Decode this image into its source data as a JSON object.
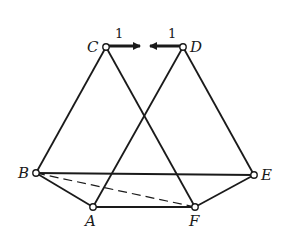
{
  "diagram": {
    "type": "truss-linkage",
    "nodes": [
      {
        "id": "C",
        "label": "C",
        "x": 106,
        "y": 47,
        "lx": 87,
        "ly": 52
      },
      {
        "id": "D",
        "label": "D",
        "x": 183,
        "y": 47,
        "lx": 190,
        "ly": 52
      },
      {
        "id": "B",
        "label": "B",
        "x": 36,
        "y": 173,
        "lx": 18,
        "ly": 178
      },
      {
        "id": "E",
        "label": "E",
        "x": 254,
        "y": 175,
        "lx": 261,
        "ly": 180
      },
      {
        "id": "A",
        "label": "A",
        "x": 93,
        "y": 207,
        "lx": 85,
        "ly": 226
      },
      {
        "id": "F",
        "label": "F",
        "x": 195,
        "y": 207,
        "lx": 189,
        "ly": 226
      }
    ],
    "members": [
      {
        "from": "C",
        "to": "B",
        "style": "solid"
      },
      {
        "from": "C",
        "to": "F",
        "style": "solid"
      },
      {
        "from": "D",
        "to": "A",
        "style": "solid"
      },
      {
        "from": "D",
        "to": "E",
        "style": "solid"
      },
      {
        "from": "B",
        "to": "E",
        "style": "solid"
      },
      {
        "from": "B",
        "to": "A",
        "style": "solid"
      },
      {
        "from": "A",
        "to": "F",
        "style": "solid"
      },
      {
        "from": "F",
        "to": "E",
        "style": "solid"
      },
      {
        "from": "B",
        "to": "F",
        "style": "dashed"
      }
    ],
    "loads": [
      {
        "at": "C",
        "label": "1",
        "x1": 108,
        "x2": 140,
        "y": 46,
        "lx": 115,
        "ly": 38
      },
      {
        "at": "D",
        "label": "1",
        "x1": 181,
        "x2": 150,
        "y": 46,
        "lx": 168,
        "ly": 38
      }
    ]
  }
}
